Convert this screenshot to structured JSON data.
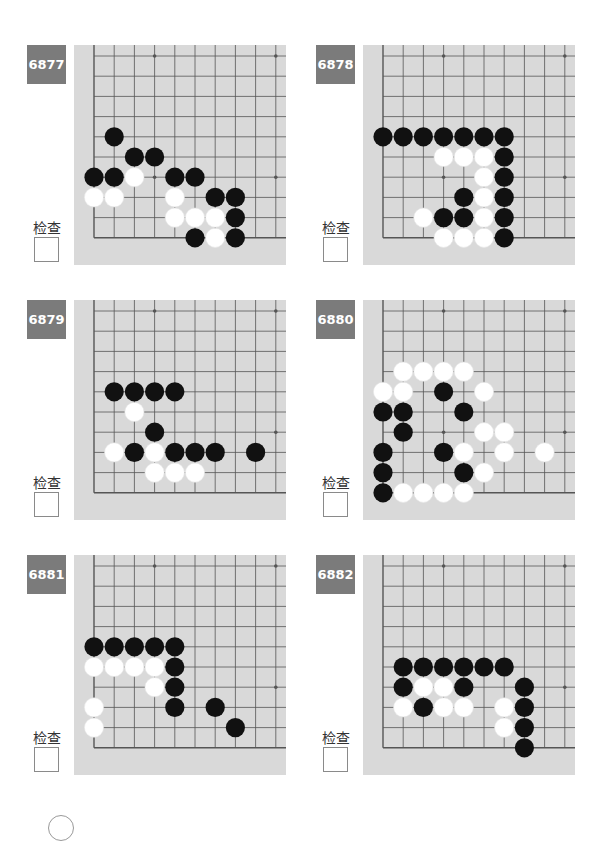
{
  "check_label": "检查",
  "colors": {
    "badge_bg": "#7b7b7b",
    "board_bg": "#d9d9d9",
    "grid_line": "#555555",
    "black_stone": "#111111",
    "white_stone": "#ffffff"
  },
  "board_geometry": {
    "grid_origin_x": 20,
    "grid_origin_y": 11,
    "spacing": 20.2,
    "visible_cols": 10,
    "visible_rows": 10,
    "corner": "bottom-left",
    "star_points": [
      [
        3,
        0
      ],
      [
        9,
        0
      ],
      [
        3,
        6
      ],
      [
        9,
        6
      ]
    ]
  },
  "problems": [
    {
      "number": "6877",
      "black": [
        [
          1,
          4
        ],
        [
          2,
          5
        ],
        [
          3,
          5
        ],
        [
          0,
          6
        ],
        [
          1,
          6
        ],
        [
          4,
          6
        ],
        [
          5,
          6
        ],
        [
          6,
          7
        ],
        [
          7,
          7
        ],
        [
          7,
          8
        ],
        [
          5,
          9
        ],
        [
          7,
          9
        ]
      ],
      "white": [
        [
          2,
          6
        ],
        [
          0,
          7
        ],
        [
          1,
          7
        ],
        [
          4,
          7
        ],
        [
          4,
          8
        ],
        [
          5,
          8
        ],
        [
          6,
          8
        ],
        [
          6,
          9
        ]
      ]
    },
    {
      "number": "6878",
      "black": [
        [
          0,
          4
        ],
        [
          1,
          4
        ],
        [
          2,
          4
        ],
        [
          3,
          4
        ],
        [
          4,
          4
        ],
        [
          5,
          4
        ],
        [
          6,
          4
        ],
        [
          6,
          5
        ],
        [
          6,
          6
        ],
        [
          4,
          7
        ],
        [
          6,
          7
        ],
        [
          3,
          8
        ],
        [
          4,
          8
        ],
        [
          6,
          8
        ],
        [
          6,
          9
        ]
      ],
      "white": [
        [
          3,
          5
        ],
        [
          4,
          5
        ],
        [
          5,
          5
        ],
        [
          5,
          6
        ],
        [
          5,
          7
        ],
        [
          2,
          8
        ],
        [
          5,
          8
        ],
        [
          3,
          9
        ],
        [
          4,
          9
        ],
        [
          5,
          9
        ]
      ]
    },
    {
      "number": "6879",
      "black": [
        [
          1,
          4
        ],
        [
          2,
          4
        ],
        [
          3,
          4
        ],
        [
          4,
          4
        ],
        [
          3,
          6
        ],
        [
          2,
          7
        ],
        [
          4,
          7
        ],
        [
          5,
          7
        ],
        [
          6,
          7
        ],
        [
          8,
          7
        ]
      ],
      "white": [
        [
          2,
          5
        ],
        [
          1,
          7
        ],
        [
          3,
          7
        ],
        [
          3,
          8
        ],
        [
          4,
          8
        ],
        [
          5,
          8
        ]
      ]
    },
    {
      "number": "6880",
      "black": [
        [
          3,
          4
        ],
        [
          0,
          5
        ],
        [
          1,
          5
        ],
        [
          4,
          5
        ],
        [
          1,
          6
        ],
        [
          0,
          7
        ],
        [
          3,
          7
        ],
        [
          0,
          8
        ],
        [
          4,
          8
        ],
        [
          0,
          9
        ]
      ],
      "white": [
        [
          1,
          3
        ],
        [
          2,
          3
        ],
        [
          3,
          3
        ],
        [
          4,
          3
        ],
        [
          0,
          4
        ],
        [
          1,
          4
        ],
        [
          5,
          4
        ],
        [
          5,
          6
        ],
        [
          6,
          6
        ],
        [
          4,
          7
        ],
        [
          6,
          7
        ],
        [
          8,
          7
        ],
        [
          5,
          8
        ],
        [
          1,
          9
        ],
        [
          2,
          9
        ],
        [
          3,
          9
        ],
        [
          4,
          9
        ]
      ]
    },
    {
      "number": "6881",
      "black": [
        [
          0,
          4
        ],
        [
          1,
          4
        ],
        [
          2,
          4
        ],
        [
          3,
          4
        ],
        [
          4,
          4
        ],
        [
          4,
          5
        ],
        [
          4,
          6
        ],
        [
          4,
          7
        ],
        [
          6,
          7
        ],
        [
          7,
          8
        ]
      ],
      "white": [
        [
          0,
          5
        ],
        [
          1,
          5
        ],
        [
          2,
          5
        ],
        [
          3,
          5
        ],
        [
          3,
          6
        ],
        [
          0,
          7
        ],
        [
          0,
          8
        ]
      ]
    },
    {
      "number": "6882",
      "black": [
        [
          1,
          5
        ],
        [
          2,
          5
        ],
        [
          3,
          5
        ],
        [
          4,
          5
        ],
        [
          5,
          5
        ],
        [
          6,
          5
        ],
        [
          1,
          6
        ],
        [
          4,
          6
        ],
        [
          7,
          6
        ],
        [
          2,
          7
        ],
        [
          7,
          7
        ],
        [
          7,
          8
        ],
        [
          7,
          9
        ]
      ],
      "white": [
        [
          2,
          6
        ],
        [
          3,
          6
        ],
        [
          1,
          7
        ],
        [
          3,
          7
        ],
        [
          4,
          7
        ],
        [
          6,
          7
        ],
        [
          6,
          8
        ]
      ]
    }
  ]
}
